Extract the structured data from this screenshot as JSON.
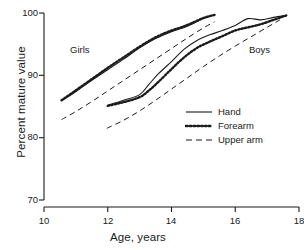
{
  "chart_data": {
    "type": "line",
    "title": "",
    "xlabel": "Age, years",
    "ylabel": "Percent mature value",
    "xlim": [
      10,
      18
    ],
    "ylim": [
      70,
      100
    ],
    "xticks": [
      10,
      12,
      14,
      16,
      18
    ],
    "yticks": [
      70,
      80,
      90,
      100
    ],
    "grid": false,
    "legend_position": "center-right",
    "annotations": [
      {
        "text": "Girls",
        "x": 11.3,
        "y": 94.2
      },
      {
        "text": "Boys",
        "x": 16.5,
        "y": 94.2
      }
    ],
    "legend": [
      {
        "name": "Hand",
        "style": "solid"
      },
      {
        "name": "Forearm",
        "style": "dotted"
      },
      {
        "name": "Upper arm",
        "style": "dashed"
      }
    ],
    "series": [
      {
        "name": "Girls Hand",
        "group": "Girls",
        "segment": "Hand",
        "style": "solid",
        "x": [
          10.55,
          11.0,
          11.5,
          12.0,
          12.5,
          13.0,
          13.5,
          14.0,
          14.3,
          14.6,
          15.0,
          15.35
        ],
        "y": [
          85.9,
          87.4,
          89.2,
          90.9,
          92.6,
          94.4,
          95.9,
          97.0,
          97.5,
          98.1,
          99.1,
          99.7
        ]
      },
      {
        "name": "Girls Forearm",
        "group": "Girls",
        "segment": "Forearm",
        "style": "dotted",
        "x": [
          10.55,
          11.0,
          11.5,
          12.0,
          12.5,
          13.0,
          13.5,
          14.0,
          14.3,
          14.6,
          15.0,
          15.35
        ],
        "y": [
          86.0,
          87.6,
          89.4,
          91.2,
          92.9,
          94.6,
          96.1,
          97.2,
          97.7,
          98.3,
          99.2,
          99.7
        ]
      },
      {
        "name": "Girls Upper arm",
        "group": "Girls",
        "segment": "Upper arm",
        "style": "dashed",
        "x": [
          10.55,
          11.0,
          11.5,
          12.0,
          12.5,
          13.0,
          13.5,
          14.0,
          14.5,
          15.0,
          15.35
        ],
        "y": [
          82.9,
          84.2,
          85.8,
          87.5,
          89.2,
          90.9,
          92.6,
          94.3,
          96.0,
          97.6,
          98.6
        ]
      },
      {
        "name": "Boys Hand",
        "group": "Boys",
        "segment": "Hand",
        "style": "solid",
        "x": [
          12.0,
          12.5,
          13.0,
          13.3,
          13.6,
          14.0,
          14.4,
          14.8,
          15.2,
          15.6,
          16.0,
          16.4,
          16.8,
          17.2,
          17.6
        ],
        "y": [
          85.2,
          86.0,
          86.9,
          88.6,
          90.3,
          92.2,
          94.2,
          95.6,
          96.5,
          97.2,
          98.0,
          99.1,
          98.9,
          99.3,
          99.6
        ]
      },
      {
        "name": "Boys Forearm",
        "group": "Boys",
        "segment": "Forearm",
        "style": "dotted",
        "x": [
          12.0,
          12.5,
          13.0,
          13.3,
          13.6,
          14.0,
          14.4,
          14.8,
          15.2,
          15.6,
          16.0,
          16.4,
          16.8,
          17.2,
          17.6
        ],
        "y": [
          85.1,
          85.7,
          86.5,
          87.6,
          89.0,
          91.0,
          92.9,
          94.4,
          95.4,
          96.3,
          97.2,
          97.7,
          98.2,
          98.9,
          99.6
        ]
      },
      {
        "name": "Boys Upper arm",
        "group": "Boys",
        "segment": "Upper arm",
        "style": "dashed",
        "x": [
          11.97,
          12.5,
          13.0,
          13.5,
          14.0,
          14.5,
          15.0,
          15.5,
          16.0,
          16.5,
          17.0,
          17.4
        ],
        "y": [
          81.5,
          82.8,
          84.3,
          86.0,
          87.8,
          89.6,
          91.4,
          93.1,
          94.7,
          96.2,
          97.7,
          98.9
        ]
      }
    ]
  },
  "axes": {
    "y_title": "Percent mature value",
    "x_title": "Age, years",
    "y_ticks": [
      "100",
      "90",
      "80",
      "70"
    ],
    "x_ticks": [
      "10",
      "12",
      "14",
      "16",
      "18"
    ]
  },
  "labels": {
    "girls": "Girls",
    "boys": "Boys"
  },
  "legend": {
    "hand": "Hand",
    "forearm": "Forearm",
    "upper_arm": "Upper arm"
  },
  "colors": {
    "ink": "#1a1a1a",
    "background": "#ffffff"
  }
}
